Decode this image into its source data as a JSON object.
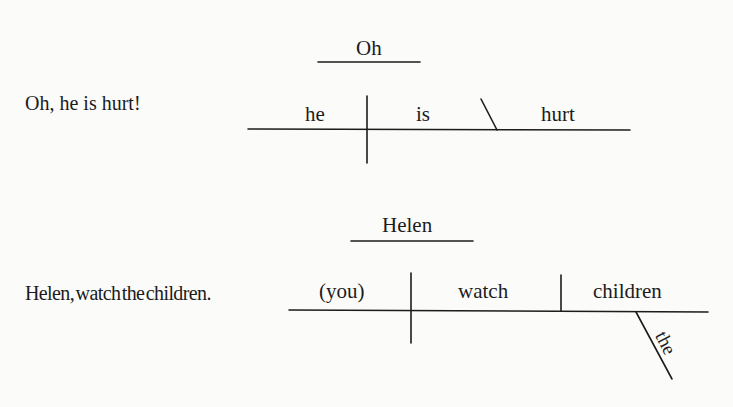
{
  "examples": [
    {
      "sentence": "Oh, he is hurt!",
      "diagram": {
        "interjection": "Oh",
        "subject": "he",
        "verb": "is",
        "predicate_adjective": "hurt"
      }
    },
    {
      "sentence": "Helen, watch the children.",
      "diagram": {
        "noun_of_address": "Helen",
        "subject": "(you)",
        "verb": "watch",
        "direct_object": "children",
        "modifier": "the"
      }
    }
  ]
}
